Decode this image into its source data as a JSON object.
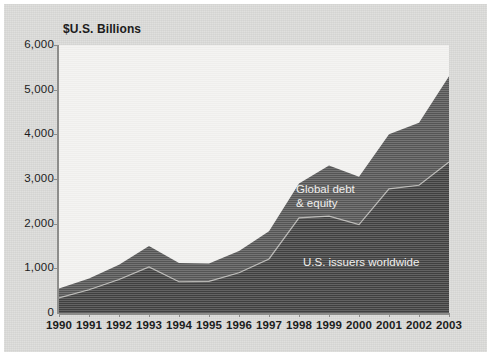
{
  "chart_data": {
    "type": "area",
    "stacked": true,
    "title": "",
    "subtitle": "",
    "xlabel": "",
    "ylabel": "$U.S. Billions",
    "axis_title": "$U.S. Billions",
    "grid": false,
    "legend_position": "in-plot-annotations",
    "x": [
      1990,
      1991,
      1992,
      1993,
      1994,
      1995,
      1996,
      1997,
      1998,
      1999,
      2000,
      2001,
      2002,
      2003
    ],
    "categories": [
      "1990",
      "1991",
      "1992",
      "1993",
      "1994",
      "1995",
      "1996",
      "1997",
      "1998",
      "1999",
      "2000",
      "2001",
      "2002",
      "2003"
    ],
    "xlim": [
      1990,
      2003
    ],
    "ylim": [
      0,
      6000
    ],
    "yticks": [
      0,
      1000,
      2000,
      3000,
      4000,
      5000,
      6000
    ],
    "ytick_labels": [
      "0",
      "1,000",
      "2,000",
      "3,000",
      "4,000",
      "5,000",
      "6,000"
    ],
    "series": [
      {
        "name": "U.S. issuers worldwide",
        "color": "#414141",
        "values": [
          340,
          520,
          750,
          1030,
          700,
          710,
          900,
          1210,
          2130,
          2170,
          1980,
          2780,
          2860,
          3380
        ]
      },
      {
        "name": "Global debt & equity",
        "color": "#565656",
        "values": [
          210,
          250,
          330,
          470,
          420,
          400,
          490,
          620,
          770,
          1130,
          1070,
          1220,
          1400,
          1920
        ]
      }
    ],
    "series_totals": {
      "name": "Total (stacked top)",
      "values": [
        550,
        770,
        1080,
        1500,
        1120,
        1110,
        1390,
        1830,
        2900,
        3300,
        3050,
        4000,
        4260,
        5300
      ]
    },
    "annotations": [
      {
        "name": "global-debt-equity",
        "text": "Global debt\n& equity",
        "color": "#f0efed"
      },
      {
        "name": "us-issuers-worldwide",
        "text": "U.S. issuers worldwide",
        "color": "#f0efed"
      }
    ],
    "colors": {
      "plot_background": "#f2f1ef",
      "card_background": "#d9d9d7",
      "page_background": "#ffffff",
      "axis": "#8d8d8b",
      "text": "#1c1c1c",
      "lower_band": "#414141",
      "upper_band": "#565656",
      "band_divider": "#b6b5b2"
    }
  },
  "axis": {
    "title": "$U.S. Billions",
    "y_labels": [
      "6,000",
      "5,000",
      "4,000",
      "3,000",
      "2,000",
      "1,000",
      "0"
    ],
    "x_labels": [
      "1990",
      "1991",
      "1992",
      "1993",
      "1994",
      "1995",
      "1996",
      "1997",
      "1998",
      "1999",
      "2000",
      "2001",
      "2002",
      "2003"
    ]
  },
  "annotations": {
    "global": "Global debt\n& equity",
    "us": "U.S. issuers worldwide"
  }
}
